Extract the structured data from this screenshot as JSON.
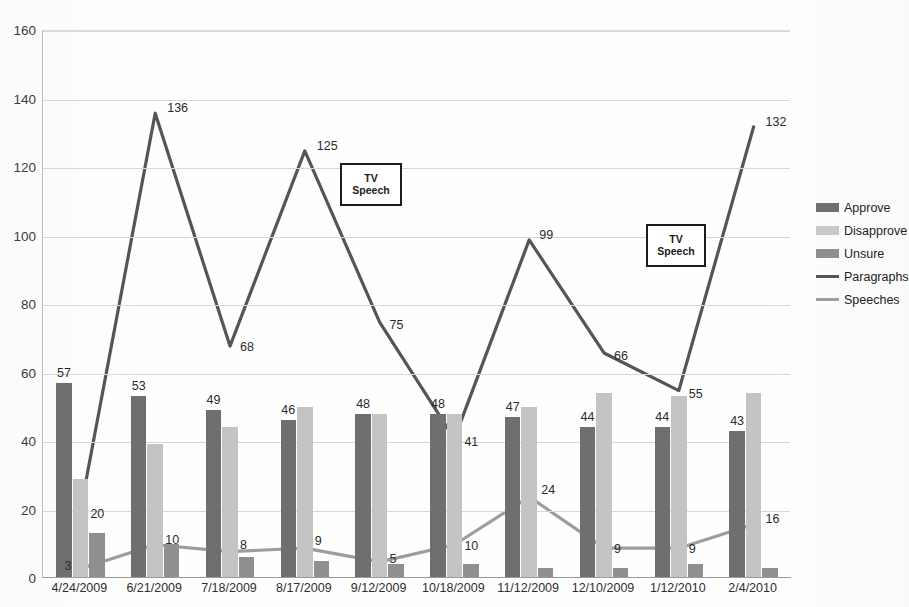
{
  "chart_data": {
    "type": "bar",
    "title": "",
    "xlabel": "",
    "ylabel": "",
    "ylim": [
      0,
      160
    ],
    "ytick_step": 20,
    "grid": true,
    "legend_position": "right",
    "categories": [
      "4/24/2009",
      "6/21/2009",
      "7/18/2009",
      "8/17/2009",
      "9/12/2009",
      "10/18/2009",
      "11/12/2009",
      "12/10/2009",
      "1/12/2010",
      "2/4/2010"
    ],
    "yticks": [
      "0",
      "20",
      "40",
      "60",
      "80",
      "100",
      "120",
      "140",
      "160"
    ],
    "series": [
      {
        "name": "Approve",
        "kind": "bar",
        "color": "#6f6f6f",
        "values": [
          57,
          53,
          49,
          46,
          48,
          48,
          47,
          44,
          44,
          43
        ],
        "labels": [
          "57",
          "53",
          "49",
          "46",
          "48",
          "48",
          "47",
          "44",
          "44",
          "43"
        ]
      },
      {
        "name": "Disapprove",
        "kind": "bar",
        "color": "#c4c4c4",
        "values": [
          29,
          39,
          44,
          50,
          48,
          48,
          50,
          54,
          53,
          54
        ],
        "labels": [
          "",
          "",
          "",
          "",
          "",
          "",
          "",
          "",
          "",
          ""
        ]
      },
      {
        "name": "Unsure",
        "kind": "bar",
        "color": "#8f8f8f",
        "values": [
          13,
          10,
          6,
          5,
          4,
          4,
          3,
          3,
          4,
          3
        ],
        "labels": [
          "",
          "",
          "",
          "",
          "",
          "",
          "",
          "",
          "",
          ""
        ]
      },
      {
        "name": "Paragraphs",
        "kind": "line",
        "color": "#555555",
        "values": [
          20,
          136,
          68,
          125,
          75,
          41,
          99,
          66,
          55,
          132
        ],
        "labels": [
          "20",
          "136",
          "68",
          "125",
          "75",
          "41",
          "99",
          "66",
          "55",
          "132"
        ]
      },
      {
        "name": "Speeches",
        "kind": "line",
        "color": "#9d9d9d",
        "values": [
          3,
          10,
          8,
          9,
          5,
          10,
          24,
          9,
          9,
          16
        ],
        "labels": [
          "3",
          "10",
          "8",
          "9",
          "5",
          "10",
          "24",
          "9",
          "9",
          "16"
        ]
      }
    ],
    "annotations": [
      {
        "text_line1": "TV",
        "text_line2": "Speech",
        "x_px": 340,
        "y_px": 163,
        "w_px": 62,
        "h_px": 43
      },
      {
        "text_line1": "TV",
        "text_line2": "Speech",
        "x_px": 646,
        "y_px": 224,
        "w_px": 60,
        "h_px": 43
      }
    ]
  },
  "legend": {
    "items": [
      {
        "label": "Approve",
        "swatch": "bar-swatch-dark"
      },
      {
        "label": "Disapprove",
        "swatch": "bar-swatch-light"
      },
      {
        "label": "Unsure",
        "swatch": "bar-swatch-medium"
      },
      {
        "label": "Paragraphs",
        "swatch": "line-swatch-dark"
      },
      {
        "label": "Speeches",
        "swatch": "line-swatch-light"
      }
    ]
  },
  "title_fragment": ""
}
